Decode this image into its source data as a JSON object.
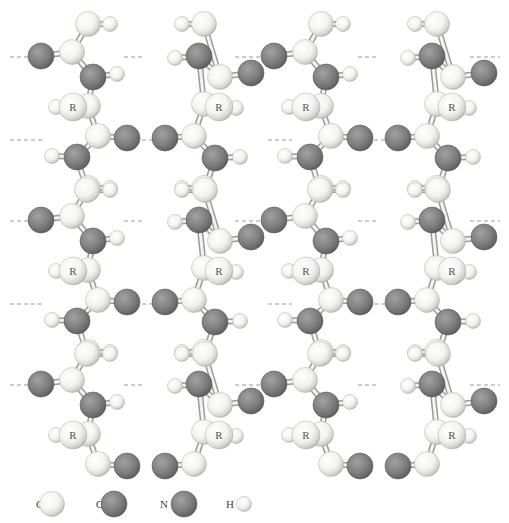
{
  "figure": {
    "title": "",
    "atom_colors": {
      "C": "#f2f2ee",
      "O": "#7a7a7a",
      "N": "#7a7a7a",
      "H": "#f4f4f0",
      "R": "#f2f2ee"
    },
    "r_label": "R"
  },
  "legend": [
    {
      "element": "C",
      "label": "C"
    },
    {
      "element": "O",
      "label": "O"
    },
    {
      "element": "N",
      "label": "N"
    },
    {
      "element": "H",
      "label": "H"
    }
  ],
  "strands": [
    {
      "id": 1,
      "direction": "down"
    },
    {
      "id": 2,
      "direction": "up"
    },
    {
      "id": 3,
      "direction": "down"
    },
    {
      "id": 4,
      "direction": "up"
    }
  ]
}
